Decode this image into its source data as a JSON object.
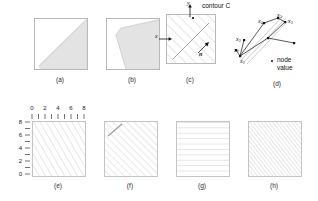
{
  "figure": {
    "title_text": "",
    "panels": [
      {
        "id": "a",
        "caption": "(a)",
        "kind": "shaded-region"
      },
      {
        "id": "b",
        "caption": "(b)",
        "kind": "shaded-region"
      },
      {
        "id": "c",
        "caption": "(c)",
        "kind": "hatched-contour"
      },
      {
        "id": "d",
        "caption": "(d)",
        "kind": "node-diagram"
      },
      {
        "id": "e",
        "caption": "(e)",
        "kind": "hatched-axes"
      },
      {
        "id": "f",
        "caption": "(f)",
        "kind": "hatched"
      },
      {
        "id": "g",
        "caption": "(g)",
        "kind": "horizontal-lines"
      },
      {
        "id": "h",
        "caption": "(h)",
        "kind": "dense-diagonal"
      }
    ]
  },
  "panel_c": {
    "contour_label": "contour C",
    "y_axis_label": "y",
    "x_axis_label": "x",
    "normal_label": "n"
  },
  "panel_d": {
    "nodes": [
      {
        "label": "x",
        "sub": "1"
      },
      {
        "label": "x",
        "sub": "2"
      },
      {
        "label": "x",
        "sub": "3"
      },
      {
        "label": "x",
        "sub": "4"
      },
      {
        "label": "x",
        "sub": "5"
      },
      {
        "label": "x",
        "sub": "*"
      }
    ],
    "legend_marker": "•",
    "legend_text": "node\nvalue"
  },
  "panel_e": {
    "x_ticks": [
      "0",
      "2",
      "4",
      "6",
      "8"
    ],
    "y_ticks": [
      "8",
      "6",
      "4",
      "2",
      "0"
    ],
    "minor_tick_count": 9
  },
  "colors": {
    "shade_fill": "#e2e2e2",
    "box_border": "#b9b9b9",
    "hatch_line": "#cfcfcf",
    "text": "#1a1a1a",
    "node": "#111111"
  }
}
